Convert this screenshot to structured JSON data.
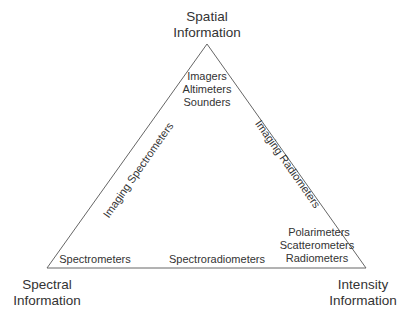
{
  "diagram": {
    "type": "triangle",
    "line_color": "#555555",
    "vertices": {
      "top": {
        "x": 207,
        "y": 44
      },
      "bottom_left": {
        "x": 47,
        "y": 268
      },
      "bottom_right": {
        "x": 366,
        "y": 268
      }
    },
    "corners": {
      "top": {
        "line1": "Spatial",
        "line2": "Information"
      },
      "bottom_left": {
        "line1": "Spectral",
        "line2": "Information"
      },
      "bottom_right": {
        "line1": "Intensity",
        "line2": "Information"
      }
    },
    "corner_instruments": {
      "top": [
        "Imagers",
        "Altimeters",
        "Sounders"
      ],
      "bottom_left": [
        "Spectrometers"
      ],
      "bottom_right": [
        "Polarimeters",
        "Scatterometers",
        "Radiometers"
      ]
    },
    "edges": {
      "left": "Imaging Spectrometers",
      "right": "Imaging Radiometers",
      "bottom": "Spectroradiometers"
    }
  }
}
